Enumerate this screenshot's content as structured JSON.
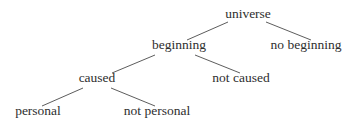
{
  "diagram": {
    "type": "tree",
    "nodes": [
      {
        "id": "universe",
        "label": "universe",
        "x": 248,
        "y": 18
      },
      {
        "id": "no_beginning",
        "label": "no beginning",
        "x": 306,
        "y": 49
      },
      {
        "id": "beginning",
        "label": "beginning",
        "x": 179,
        "y": 49
      },
      {
        "id": "not_caused",
        "label": "not caused",
        "x": 241,
        "y": 82
      },
      {
        "id": "caused",
        "label": "caused",
        "x": 97,
        "y": 82
      },
      {
        "id": "personal",
        "label": "personal",
        "x": 38,
        "y": 115
      },
      {
        "id": "not_personal",
        "label": "not personal",
        "x": 157,
        "y": 115
      }
    ],
    "edges": [
      {
        "from": "universe",
        "to": "beginning",
        "x1": 228,
        "y1": 22,
        "x2": 187,
        "y2": 40
      },
      {
        "from": "universe",
        "to": "no_beginning",
        "x1": 266,
        "y1": 22,
        "x2": 311,
        "y2": 40
      },
      {
        "from": "beginning",
        "to": "caused",
        "x1": 155,
        "y1": 55,
        "x2": 112,
        "y2": 73
      },
      {
        "from": "beginning",
        "to": "not_caused",
        "x1": 195,
        "y1": 55,
        "x2": 240,
        "y2": 73
      },
      {
        "from": "caused",
        "to": "personal",
        "x1": 83,
        "y1": 88,
        "x2": 42,
        "y2": 106
      },
      {
        "from": "caused",
        "to": "not_personal",
        "x1": 111,
        "y1": 88,
        "x2": 155,
        "y2": 106
      }
    ]
  }
}
